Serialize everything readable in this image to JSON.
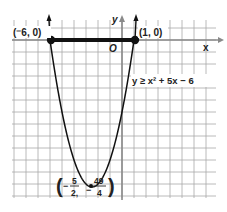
{
  "chart_data": {
    "type": "line",
    "title": "",
    "xlabel": "x",
    "ylabel": "y",
    "origin_label": "O",
    "function": "y = x^2 + 5x - 6",
    "inequality_label": "y ≥ x² + 5x − 6",
    "xlim": [
      -9,
      7
    ],
    "ylim": [
      -13,
      1.5
    ],
    "grid": true,
    "series": [
      {
        "name": "parabola",
        "x": [
          -6,
          -5.5,
          -5,
          -4.5,
          -4,
          -3.5,
          -3,
          -2.5,
          -2,
          -1.5,
          -1,
          -0.5,
          0,
          0.5,
          1
        ],
        "y": [
          0,
          -2.75,
          -6,
          -8.25,
          -10,
          -11.25,
          -12,
          -12.25,
          -12,
          -11.25,
          -10,
          -8.25,
          -6,
          -2.75,
          0
        ]
      },
      {
        "name": "solution-segment",
        "x": [
          -6,
          1
        ],
        "y": [
          0,
          0
        ]
      }
    ],
    "points": [
      {
        "label": "(⁻6, 0)",
        "x": -6,
        "y": 0
      },
      {
        "label": "(1, 0)",
        "x": 1,
        "y": 0
      },
      {
        "label": "vertex",
        "x": -2.5,
        "y": -12.25,
        "x_num": "5",
        "x_den": "2",
        "y_num": "49",
        "y_den": "4"
      }
    ]
  },
  "labels": {
    "point_left": "(⁻6, 0)",
    "point_right": "(1, 0)",
    "x_axis": "x",
    "y_axis": "y",
    "origin": "O",
    "inequality": "y ≥ x² + 5x − 6",
    "vertex_x_num": "5",
    "vertex_x_den": "2,",
    "vertex_y_num": "49",
    "vertex_y_den": "4",
    "minus": "−"
  },
  "colors": {
    "grid": "#9a9a9a",
    "axis": "#888888",
    "curve": "#111111",
    "text": "#222222"
  }
}
